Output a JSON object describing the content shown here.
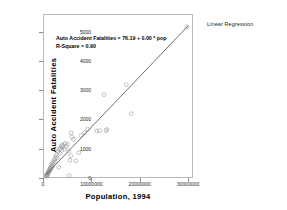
{
  "corner_title": "Linear Regression",
  "annotation": {
    "line1": "Auto Accident Fatalities = 76.19 + 0.00 * pop",
    "line2": "R-Square = 0.90"
  },
  "chart_data": {
    "type": "scatter",
    "title": "Linear Regression",
    "xlabel": "Population, 1994",
    "ylabel": "Auto Accident Fatalities",
    "xlim": [
      0,
      31000000
    ],
    "ylim": [
      0,
      5600
    ],
    "grid": false,
    "legend": "none",
    "xticks": [
      0,
      10000000,
      20000000,
      30000000
    ],
    "xtick_labels": [
      "0",
      "10000000",
      "20000000",
      "30000000"
    ],
    "yticks": [
      0,
      1000,
      2000,
      3000,
      4000,
      5000
    ],
    "ytick_labels": [
      "0",
      "1000",
      "2000",
      "3000",
      "4000",
      "5000"
    ],
    "marker": "open-circle",
    "marker_color": "#9a9a9a",
    "line_color": "#4a4a4a",
    "fit_line": {
      "type": "linear",
      "intercept": 76.19,
      "slope": 0.000173,
      "r_square": 0.9,
      "x_start": 480000,
      "x_end": 29800000,
      "equation": "Auto Accident Fatalities = 76.19 + 0.00 * pop"
    },
    "points": [
      [
        470000,
        105
      ],
      [
        520000,
        120
      ],
      [
        580000,
        135
      ],
      [
        600000,
        95
      ],
      [
        610000,
        150
      ],
      [
        640000,
        160
      ],
      [
        700000,
        175
      ],
      [
        720000,
        130
      ],
      [
        760000,
        190
      ],
      [
        800000,
        210
      ],
      [
        880000,
        225
      ],
      [
        930000,
        250
      ],
      [
        1000000,
        240
      ],
      [
        1060000,
        280
      ],
      [
        1130000,
        300
      ],
      [
        1170000,
        270
      ],
      [
        1220000,
        330
      ],
      [
        1240000,
        370
      ],
      [
        1400000,
        390
      ],
      [
        1480000,
        420
      ],
      [
        1550000,
        350
      ],
      [
        1620000,
        470
      ],
      [
        1650000,
        520
      ],
      [
        1770000,
        440
      ],
      [
        1830000,
        560
      ],
      [
        2060000,
        620
      ],
      [
        2220000,
        690
      ],
      [
        2350000,
        580
      ],
      [
        2470000,
        760
      ],
      [
        2540000,
        840
      ],
      [
        2770000,
        720
      ],
      [
        2850000,
        930
      ],
      [
        3050000,
        400
      ],
      [
        3140000,
        1010
      ],
      [
        3270000,
        880
      ],
      [
        3350000,
        1060
      ],
      [
        3600000,
        1130
      ],
      [
        3690000,
        980
      ],
      [
        3830000,
        1160
      ],
      [
        3930000,
        1100
      ],
      [
        4220000,
        1020
      ],
      [
        4350000,
        1220
      ],
      [
        4600000,
        1110
      ],
      [
        4780000,
        1190
      ],
      [
        5100000,
        950
      ],
      [
        5200000,
        110
      ],
      [
        5370000,
        640
      ],
      [
        5550000,
        790
      ],
      [
        5610000,
        1580
      ],
      [
        5760000,
        1440
      ],
      [
        6100000,
        1350
      ],
      [
        6600000,
        620
      ],
      [
        7200000,
        900
      ],
      [
        7700000,
        1490
      ],
      [
        8400000,
        1580
      ],
      [
        9000000,
        1700
      ],
      [
        10900000,
        1640
      ],
      [
        11500000,
        1650
      ],
      [
        12400000,
        2880
      ],
      [
        12800000,
        1650
      ],
      [
        13000000,
        1690
      ],
      [
        17000000,
        3220
      ],
      [
        18000000,
        2230
      ],
      [
        29500000,
        5200
      ]
    ]
  }
}
